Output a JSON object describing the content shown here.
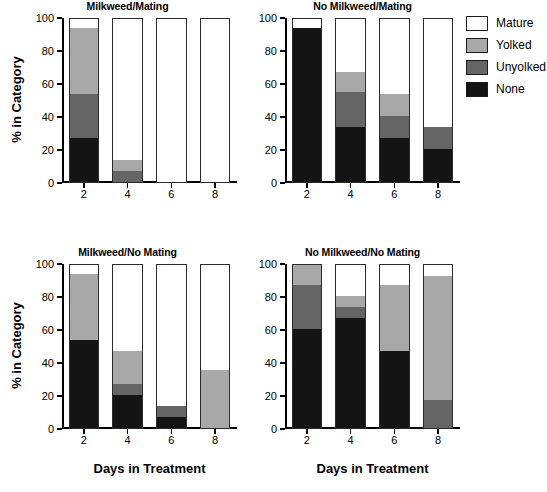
{
  "figure": {
    "ylabel": "% in Category",
    "xlabel": "Days in Treatment"
  },
  "legend": {
    "title": "",
    "items": [
      {
        "label": "Mature",
        "color": "#ffffff"
      },
      {
        "label": "Yolked",
        "color": "#a8a8a8"
      },
      {
        "label": "Unyolked",
        "color": "#656565"
      },
      {
        "label": "None",
        "color": "#141414"
      }
    ]
  },
  "axes": {
    "y_ticks": [
      "0",
      "20",
      "40",
      "60",
      "80",
      "100"
    ],
    "x_ticks": [
      "2",
      "4",
      "6",
      "8"
    ],
    "ylim": [
      0,
      100
    ]
  },
  "chart_data": [
    {
      "id": "milkweed-mating",
      "type": "bar",
      "stacked": true,
      "title": "Milkweed/Mating",
      "xlabel": "Days in Treatment",
      "ylabel": "% in Category",
      "ylim": [
        0,
        100
      ],
      "grid": false,
      "categories": [
        "2",
        "4",
        "6",
        "8"
      ],
      "series": [
        {
          "name": "None",
          "color": "#141414",
          "values": [
            26.7,
            0.0,
            0.0,
            0.0
          ]
        },
        {
          "name": "Unyolked",
          "color": "#656565",
          "values": [
            26.7,
            6.7,
            0.0,
            0.0
          ]
        },
        {
          "name": "Yolked",
          "color": "#a8a8a8",
          "values": [
            40.0,
            6.7,
            0.0,
            0.0
          ]
        },
        {
          "name": "Mature",
          "color": "#ffffff",
          "values": [
            6.6,
            86.6,
            100.0,
            100.0
          ]
        }
      ]
    },
    {
      "id": "no-milkweed-mating",
      "type": "bar",
      "stacked": true,
      "title": "No Milkweed/Mating",
      "xlabel": "Days in Treatment",
      "ylabel": "% in Category",
      "ylim": [
        0,
        100
      ],
      "grid": false,
      "categories": [
        "2",
        "4",
        "6",
        "8"
      ],
      "series": [
        {
          "name": "None",
          "color": "#141414",
          "values": [
            93.3,
            33.3,
            26.7,
            20.0
          ]
        },
        {
          "name": "Unyolked",
          "color": "#656565",
          "values": [
            0.0,
            21.4,
            13.3,
            13.3
          ]
        },
        {
          "name": "Yolked",
          "color": "#a8a8a8",
          "values": [
            0.0,
            12.0,
            13.3,
            0.0
          ]
        },
        {
          "name": "Mature",
          "color": "#ffffff",
          "values": [
            6.7,
            33.3,
            46.7,
            66.7
          ]
        }
      ]
    },
    {
      "id": "milkweed-no-mating",
      "type": "bar",
      "stacked": true,
      "title": "Milkweed/No Mating",
      "xlabel": "Days in Treatment",
      "ylabel": "% in Category",
      "ylim": [
        0,
        100
      ],
      "grid": false,
      "categories": [
        "2",
        "4",
        "6",
        "8"
      ],
      "series": [
        {
          "name": "None",
          "color": "#141414",
          "values": [
            53.3,
            20.0,
            6.7,
            0.0
          ]
        },
        {
          "name": "Unyolked",
          "color": "#656565",
          "values": [
            0.0,
            6.7,
            6.6,
            0.0
          ]
        },
        {
          "name": "Yolked",
          "color": "#a8a8a8",
          "values": [
            40.0,
            20.0,
            0.0,
            35.3
          ]
        },
        {
          "name": "Mature",
          "color": "#ffffff",
          "values": [
            6.7,
            53.3,
            86.7,
            64.7
          ]
        }
      ]
    },
    {
      "id": "no-milkweed-no-mating",
      "type": "bar",
      "stacked": true,
      "title": "No Milkweed/No Mating",
      "xlabel": "Days in Treatment",
      "ylabel": "% in Category",
      "ylim": [
        0,
        100
      ],
      "grid": false,
      "categories": [
        "2",
        "4",
        "6",
        "8"
      ],
      "series": [
        {
          "name": "None",
          "color": "#141414",
          "values": [
            60.0,
            66.7,
            46.7,
            0.0
          ]
        },
        {
          "name": "Unyolked",
          "color": "#656565",
          "values": [
            26.7,
            6.6,
            0.0,
            17.0
          ]
        },
        {
          "name": "Yolked",
          "color": "#a8a8a8",
          "values": [
            13.3,
            6.7,
            40.0,
            75.0
          ]
        },
        {
          "name": "Mature",
          "color": "#ffffff",
          "values": [
            0.0,
            20.0,
            13.3,
            8.0
          ]
        }
      ]
    }
  ]
}
